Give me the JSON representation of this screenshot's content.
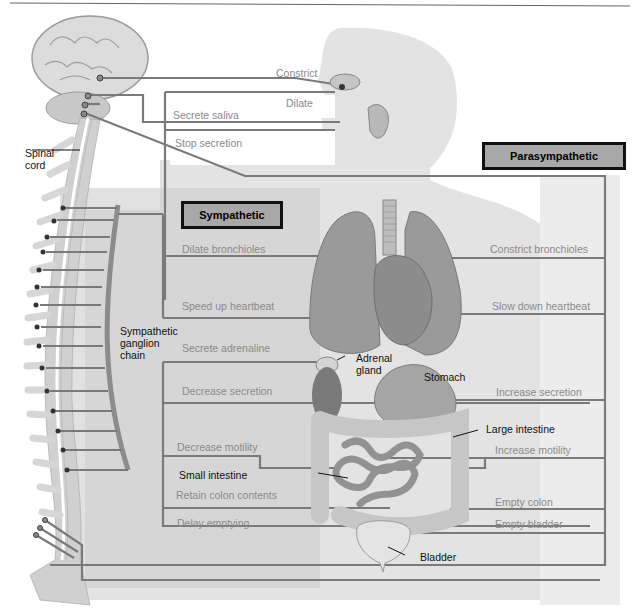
{
  "boxes": {
    "sympathetic": "Sympathetic",
    "parasympathetic": "Parasympathetic"
  },
  "anatomy_labels": {
    "spinal_cord": [
      "Spinal",
      "cord"
    ],
    "ganglion_chain": [
      "Sympathetic",
      "ganglion",
      "chain"
    ],
    "adrenal_gland": [
      "Adrenal",
      "gland"
    ],
    "stomach": "Stomach",
    "large_intestine": "Large intestine",
    "small_intestine": "Small intestine",
    "bladder": "Bladder"
  },
  "parasympathetic_head": {
    "constrict": "Constrict",
    "dilate": "Dilate",
    "secrete_saliva": "Secrete saliva",
    "stop_secretion": "Stop secretion"
  },
  "sympathetic_effects": [
    "Dilate bronchioles",
    "Speed up heartbeat",
    "Secrete adrenaline",
    "Decrease secretion",
    "Decrease motility",
    "Retain colon contents",
    "Delay emptying"
  ],
  "parasympathetic_effects": [
    "Constrict bronchioles",
    "Slow down heartbeat",
    "Increase secretion",
    "Increase motility",
    "Empty colon",
    "Empty bladder"
  ],
  "colors": {
    "nerve_line": "#7a7a7a",
    "box_fill": "#a8a8a8",
    "box_border": "#111111",
    "body_fill": "#e2e2e2",
    "sympathetic_region": "#cfcfcf",
    "organ": "#9a9a9a"
  }
}
